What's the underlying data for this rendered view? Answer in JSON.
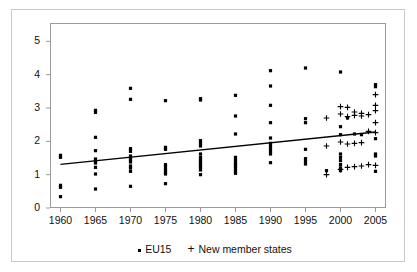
{
  "chart_data": {
    "type": "scatter",
    "title": "",
    "xlabel": "",
    "ylabel": "",
    "xlim": [
      1958.5,
      2006.5
    ],
    "ylim": [
      0,
      5.55
    ],
    "grid": false,
    "xticks": [
      1960,
      1965,
      1970,
      1975,
      1980,
      1985,
      1990,
      1995,
      2000,
      2005
    ],
    "yticks": [
      0,
      1,
      2,
      3,
      4,
      5
    ],
    "legend_position": "bottom-center",
    "series": [
      {
        "name": "EU15",
        "marker": "square",
        "color": "#000000",
        "points": [
          [
            1960,
            1.58
          ],
          [
            1960,
            1.52
          ],
          [
            1960,
            0.68
          ],
          [
            1960,
            0.62
          ],
          [
            1960,
            0.34
          ],
          [
            1965,
            2.93
          ],
          [
            1965,
            2.87
          ],
          [
            1965,
            2.12
          ],
          [
            1965,
            1.72
          ],
          [
            1965,
            1.47
          ],
          [
            1965,
            1.41
          ],
          [
            1965,
            1.35
          ],
          [
            1965,
            1.22
          ],
          [
            1965,
            1.02
          ],
          [
            1965,
            0.57
          ],
          [
            1970,
            3.59
          ],
          [
            1970,
            3.26
          ],
          [
            1970,
            1.78
          ],
          [
            1970,
            1.7
          ],
          [
            1970,
            1.56
          ],
          [
            1970,
            1.5
          ],
          [
            1970,
            1.44
          ],
          [
            1970,
            1.38
          ],
          [
            1970,
            1.26
          ],
          [
            1970,
            1.2
          ],
          [
            1970,
            1.1
          ],
          [
            1970,
            0.65
          ],
          [
            1975,
            3.22
          ],
          [
            1975,
            1.82
          ],
          [
            1975,
            1.76
          ],
          [
            1975,
            1.3
          ],
          [
            1975,
            1.22
          ],
          [
            1975,
            1.14
          ],
          [
            1975,
            1.08
          ],
          [
            1975,
            1.02
          ],
          [
            1975,
            0.73
          ],
          [
            1980,
            3.28
          ],
          [
            1980,
            3.24
          ],
          [
            1980,
            2.02
          ],
          [
            1980,
            1.94
          ],
          [
            1980,
            1.86
          ],
          [
            1980,
            1.62
          ],
          [
            1980,
            1.52
          ],
          [
            1980,
            1.46
          ],
          [
            1980,
            1.4
          ],
          [
            1980,
            1.34
          ],
          [
            1980,
            1.28
          ],
          [
            1980,
            1.22
          ],
          [
            1980,
            1.14
          ],
          [
            1980,
            1.0
          ],
          [
            1985,
            3.38
          ],
          [
            1985,
            2.76
          ],
          [
            1985,
            2.22
          ],
          [
            1985,
            1.52
          ],
          [
            1985,
            1.44
          ],
          [
            1985,
            1.36
          ],
          [
            1985,
            1.3
          ],
          [
            1985,
            1.24
          ],
          [
            1985,
            1.18
          ],
          [
            1985,
            1.1
          ],
          [
            1985,
            1.04
          ],
          [
            1990,
            4.12
          ],
          [
            1990,
            3.66
          ],
          [
            1990,
            3.08
          ],
          [
            1990,
            2.56
          ],
          [
            1990,
            2.1
          ],
          [
            1990,
            1.94
          ],
          [
            1990,
            1.86
          ],
          [
            1990,
            1.78
          ],
          [
            1990,
            1.7
          ],
          [
            1990,
            1.62
          ],
          [
            1990,
            1.36
          ],
          [
            1995,
            4.2
          ],
          [
            1995,
            2.68
          ],
          [
            1995,
            2.56
          ],
          [
            1995,
            1.76
          ],
          [
            1995,
            1.48
          ],
          [
            1995,
            1.4
          ],
          [
            1995,
            1.32
          ],
          [
            1998,
            1.12
          ],
          [
            2000,
            4.08
          ],
          [
            2000,
            2.44
          ],
          [
            2000,
            2.2
          ],
          [
            2000,
            1.62
          ],
          [
            2000,
            1.52
          ],
          [
            2000,
            1.42
          ],
          [
            2000,
            1.3
          ],
          [
            2000,
            1.2
          ],
          [
            2000,
            1.12
          ],
          [
            2001,
            2.7
          ],
          [
            2002,
            2.22
          ],
          [
            2003,
            2.2
          ],
          [
            2005,
            3.7
          ],
          [
            2005,
            3.64
          ],
          [
            2005,
            2.08
          ],
          [
            2005,
            1.62
          ],
          [
            2005,
            1.56
          ],
          [
            2005,
            1.1
          ]
        ]
      },
      {
        "name": "New member states",
        "marker": "plus",
        "color": "#000000",
        "points": [
          [
            1998,
            2.7
          ],
          [
            1998,
            1.86
          ],
          [
            1998,
            1.0
          ],
          [
            2000,
            3.04
          ],
          [
            2000,
            2.82
          ],
          [
            2000,
            1.98
          ],
          [
            2000,
            1.16
          ],
          [
            2001,
            3.02
          ],
          [
            2001,
            2.74
          ],
          [
            2001,
            1.92
          ],
          [
            2001,
            1.22
          ],
          [
            2002,
            2.88
          ],
          [
            2002,
            2.78
          ],
          [
            2002,
            1.94
          ],
          [
            2002,
            1.24
          ],
          [
            2003,
            2.84
          ],
          [
            2003,
            2.76
          ],
          [
            2003,
            1.96
          ],
          [
            2003,
            1.26
          ],
          [
            2004,
            2.8
          ],
          [
            2004,
            2.3
          ],
          [
            2004,
            1.3
          ],
          [
            2005,
            3.4
          ],
          [
            2005,
            3.08
          ],
          [
            2005,
            2.92
          ],
          [
            2005,
            2.56
          ],
          [
            2005,
            2.26
          ],
          [
            2005,
            1.28
          ]
        ]
      }
    ],
    "trendline": {
      "name": "linear-trend",
      "x": [
        1960,
        2005
      ],
      "y": [
        1.31,
        2.28
      ],
      "color": "#000000"
    }
  },
  "legend": {
    "items": [
      {
        "marker": "square",
        "label": "EU15"
      },
      {
        "marker": "plus",
        "label": "New member states"
      }
    ]
  }
}
